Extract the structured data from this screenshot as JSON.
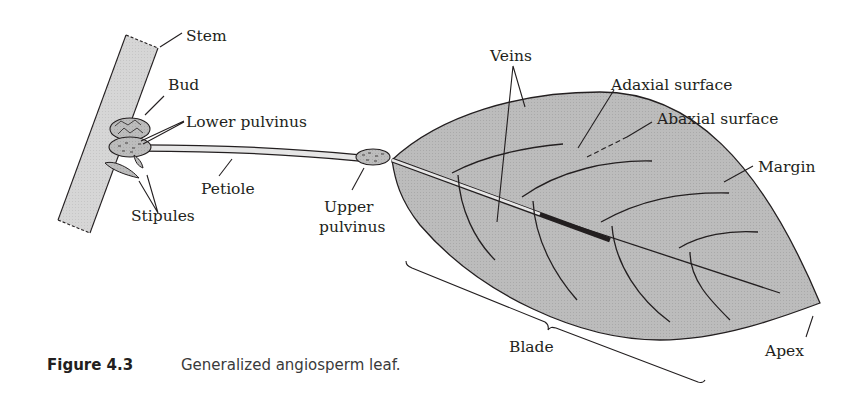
{
  "figure": {
    "number": "Figure 4.3",
    "caption": "Generalized angiosperm leaf."
  },
  "labels": {
    "stem": "Stem",
    "bud": "Bud",
    "lower_pulvinus": "Lower pulvinus",
    "petiole": "Petiole",
    "stipules": "Stipules",
    "upper_pulvinus_line1": "Upper",
    "upper_pulvinus_line2": "pulvinus",
    "veins": "Veins",
    "adaxial_surface": "Adaxial surface",
    "abaxial_surface": "Abaxial surface",
    "margin": "Margin",
    "blade": "Blade",
    "apex": "Apex"
  },
  "colors": {
    "leaf_fill": "#bdbdbd",
    "stem_fill": "#d9d9d9",
    "outline": "#231f20"
  }
}
